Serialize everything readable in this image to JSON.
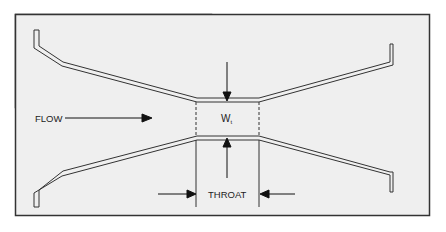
{
  "diagram": {
    "type": "venturi-throat-schematic",
    "labels": {
      "flow": "FLOW",
      "width": "W",
      "width_subscript": "t",
      "throat": "THROAT"
    },
    "colors": {
      "background": "#efefef",
      "border": "#333333",
      "line": "#333333"
    }
  }
}
